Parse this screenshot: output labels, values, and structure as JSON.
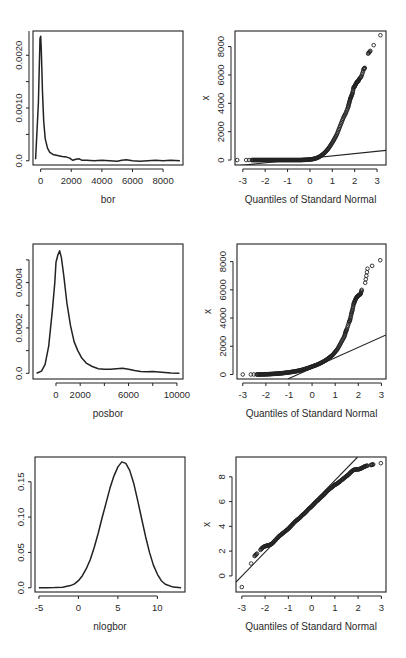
{
  "page": {
    "width": 406,
    "height": 658,
    "background": "#ffffff",
    "ink": "#222222"
  },
  "chart_data": [
    {
      "id": "density-bor",
      "type": "line",
      "title": "",
      "xlabel": "bor",
      "ylabel": "",
      "frame": {
        "x": 33,
        "y": 31,
        "w": 150,
        "h": 134
      },
      "xlim": [
        -500,
        9300
      ],
      "ylim": [
        -8e-05,
        0.00246
      ],
      "xticks": [
        0,
        2000,
        4000,
        6000,
        8000
      ],
      "xticklabels": [
        "0",
        "2000",
        "4000",
        "6000",
        "8000"
      ],
      "yticks": [
        0.0,
        0.0005,
        0.001,
        0.0015,
        0.002,
        0.0025
      ],
      "yticklabels": [
        "0.0",
        "",
        "0.0010",
        "",
        "0.0020",
        ""
      ],
      "grid": false,
      "series": [
        {
          "name": "density",
          "x": [
            -330,
            -150,
            -40,
            0,
            40,
            120,
            200,
            300,
            450,
            600,
            800,
            1100,
            1400,
            1700,
            1900,
            2100,
            2300,
            2500,
            2700,
            3000,
            3500,
            4000,
            4500,
            5000,
            5300,
            5600,
            6000,
            6500,
            7000,
            7500,
            8000,
            8500,
            9100
          ],
          "y": [
            3e-05,
            0.0011,
            0.00232,
            0.00236,
            0.0021,
            0.0013,
            0.00075,
            0.00042,
            0.00024,
            0.00016,
            0.00012,
            0.0001,
            8e-05,
            7e-05,
            5e-05,
            1e-05,
            3e-05,
            4e-05,
            1e-05,
            1e-05,
            0.0,
            1e-05,
            0.0,
            -1e-05,
            1e-05,
            2e-05,
            0.0,
            -1e-05,
            0.0,
            1e-05,
            0.0,
            1e-05,
            0.0
          ]
        }
      ]
    },
    {
      "id": "qq-bor",
      "type": "scatter",
      "title": "",
      "xlabel": "Quantiles of Standard Normal",
      "ylabel": "x",
      "frame": {
        "x": 235,
        "y": 31,
        "w": 151,
        "h": 134
      },
      "xlim": [
        -3.35,
        3.4
      ],
      "ylim": [
        -350,
        9100
      ],
      "xticks": [
        -3,
        -2,
        -1,
        0,
        1,
        2,
        3
      ],
      "xticklabels": [
        "-3",
        "-2",
        "-1",
        "0",
        "1",
        "2",
        "3"
      ],
      "yticks": [
        0,
        2000,
        4000,
        6000,
        8000
      ],
      "yticklabels": [
        "0",
        "2000",
        "4000",
        "6000",
        "8000"
      ],
      "grid": false,
      "reference_line": {
        "x": [
          -3.35,
          3.4
        ],
        "y": [
          -420,
          680
        ]
      },
      "series": [
        {
          "name": "sample quantiles",
          "x": [
            -3.25,
            -2.85,
            -2.72,
            -2.6,
            -2.5,
            -2.4,
            -2.3,
            -2.2,
            -2.1,
            -2.0,
            -1.9,
            -1.8,
            -1.7,
            -1.6,
            -1.5,
            -1.4,
            -1.3,
            -1.2,
            -1.1,
            -1.0,
            -0.9,
            -0.8,
            -0.7,
            -0.6,
            -0.5,
            -0.4,
            -0.3,
            -0.2,
            -0.1,
            0.0,
            0.1,
            0.2,
            0.3,
            0.4,
            0.5,
            0.6,
            0.7,
            0.8,
            0.9,
            1.0,
            1.1,
            1.2,
            1.3,
            1.4,
            1.5,
            1.6,
            1.7,
            1.75,
            1.8,
            1.85,
            1.9,
            1.95,
            2.0,
            2.05,
            2.1,
            2.15,
            2.2,
            2.3,
            2.4,
            2.45,
            2.6,
            2.7,
            2.85,
            3.15
          ],
          "y": [
            0,
            0,
            0,
            0,
            0,
            0,
            0,
            0,
            0,
            0,
            0,
            0,
            0,
            0,
            0,
            0,
            0,
            0,
            0,
            0,
            0,
            0,
            0,
            0,
            0,
            0,
            10,
            15,
            25,
            40,
            60,
            90,
            140,
            210,
            310,
            430,
            580,
            760,
            980,
            1230,
            1500,
            1800,
            2200,
            2600,
            3000,
            3300,
            3700,
            4000,
            4300,
            4500,
            4700,
            5100,
            5200,
            5350,
            5500,
            5550,
            5700,
            5900,
            6400,
            6500,
            7500,
            7700,
            8100,
            8800
          ]
        }
      ]
    },
    {
      "id": "density-posbor",
      "type": "line",
      "title": "",
      "xlabel": "posbor",
      "ylabel": "",
      "frame": {
        "x": 33,
        "y": 244,
        "w": 150,
        "h": 135
      },
      "xlim": [
        -1900,
        10500
      ],
      "ylim": [
        -2.5e-05,
        0.00057
      ],
      "xticks": [
        0,
        2000,
        4000,
        6000,
        8000,
        10000
      ],
      "xticklabels": [
        "0",
        "2000",
        "",
        "6000",
        "",
        "10000"
      ],
      "yticks": [
        0.0,
        0.0001,
        0.0002,
        0.0003,
        0.0004,
        0.0005
      ],
      "yticklabels": [
        "0.0",
        "",
        "0.0002",
        "",
        "0.0004",
        ""
      ],
      "grid": false,
      "series": [
        {
          "name": "density",
          "x": [
            -1600,
            -1200,
            -900,
            -600,
            -300,
            -100,
            0,
            150,
            300,
            450,
            650,
            900,
            1200,
            1500,
            1800,
            2100,
            2500,
            3000,
            3500,
            4000,
            4500,
            5000,
            5500,
            6000,
            6500,
            7000,
            7500,
            8000,
            8500,
            9000,
            9500,
            10200
          ],
          "y": [
            0.0,
            1e-05,
            4e-05,
            0.00012,
            0.00028,
            0.0004,
            0.00049,
            0.00052,
            0.00054,
            0.00051,
            0.00043,
            0.00031,
            0.00021,
            0.00014,
            0.0001,
            7e-05,
            4.5e-05,
            3e-05,
            2e-05,
            1.8e-05,
            1.8e-05,
            2e-05,
            2.2e-05,
            1.8e-05,
            1.2e-05,
            8e-06,
            7e-06,
            8e-06,
            6e-06,
            4e-06,
            2e-06,
            0.0
          ]
        }
      ]
    },
    {
      "id": "qq-posbor",
      "type": "scatter",
      "title": "",
      "xlabel": "Quantiles of Standard Normal",
      "ylabel": "x",
      "frame": {
        "x": 237,
        "y": 244,
        "w": 149,
        "h": 135
      },
      "xlim": [
        -3.25,
        3.2
      ],
      "ylim": [
        -320,
        9250
      ],
      "xticks": [
        -3,
        -2,
        -1,
        0,
        1,
        2,
        3
      ],
      "xticklabels": [
        "-3",
        "-2",
        "-1",
        "0",
        "1",
        "2",
        "3"
      ],
      "yticks": [
        0,
        2000,
        4000,
        6000,
        8000
      ],
      "yticklabels": [
        "0",
        "2000",
        "4000",
        "6000",
        "8000"
      ],
      "grid": false,
      "reference_line": {
        "x": [
          -1.05,
          3.2
        ],
        "y": [
          -320,
          2800
        ]
      },
      "series": [
        {
          "name": "sample quantiles",
          "x": [
            -3.0,
            -2.65,
            -2.52,
            -2.4,
            -2.3,
            -2.2,
            -2.1,
            -2.0,
            -1.9,
            -1.8,
            -1.7,
            -1.6,
            -1.5,
            -1.4,
            -1.3,
            -1.2,
            -1.1,
            -1.0,
            -0.9,
            -0.8,
            -0.7,
            -0.6,
            -0.5,
            -0.4,
            -0.3,
            -0.2,
            -0.1,
            0.0,
            0.1,
            0.2,
            0.3,
            0.4,
            0.5,
            0.6,
            0.7,
            0.8,
            0.9,
            1.0,
            1.1,
            1.2,
            1.3,
            1.4,
            1.45,
            1.5,
            1.6,
            1.65,
            1.7,
            1.75,
            1.8,
            1.85,
            1.9,
            1.95,
            2.0,
            2.1,
            2.15,
            2.3,
            2.4,
            2.6,
            2.95
          ],
          "y": [
            0,
            0,
            0,
            0,
            0,
            5,
            10,
            15,
            20,
            30,
            40,
            50,
            60,
            75,
            90,
            110,
            130,
            150,
            175,
            200,
            230,
            260,
            300,
            340,
            390,
            440,
            500,
            560,
            620,
            680,
            750,
            830,
            920,
            1020,
            1140,
            1260,
            1400,
            1600,
            1800,
            2100,
            2400,
            2700,
            3000,
            3200,
            3700,
            3900,
            4300,
            4600,
            5000,
            5200,
            5400,
            5500,
            5600,
            5700,
            6000,
            6500,
            7500,
            7700,
            8100,
            8800
          ]
        }
      ]
    },
    {
      "id": "density-nlogbor",
      "type": "line",
      "title": "",
      "xlabel": "nlogbor",
      "ylabel": "",
      "frame": {
        "x": 35,
        "y": 457,
        "w": 150,
        "h": 135
      },
      "xlim": [
        -5.5,
        13.5
      ],
      "ylim": [
        -0.006,
        0.185
      ],
      "xticks": [
        -5,
        0,
        5,
        10
      ],
      "xticklabels": [
        "-5",
        "0",
        "5",
        "10"
      ],
      "yticks": [
        0.0,
        0.05,
        0.1,
        0.15
      ],
      "yticklabels": [
        "0.0",
        "0.05",
        "0.10",
        "0.15"
      ],
      "grid": false,
      "series": [
        {
          "name": "density",
          "x": [
            -5,
            -4,
            -3,
            -2,
            -1,
            -0.5,
            0,
            0.5,
            1,
            1.5,
            2,
            2.5,
            3,
            3.5,
            4,
            4.5,
            5,
            5.5,
            6,
            6.5,
            7,
            7.5,
            8,
            8.5,
            9,
            9.5,
            10,
            10.5,
            11,
            12,
            13
          ],
          "y": [
            0.0,
            0.0,
            0.0002,
            0.0008,
            0.003,
            0.0055,
            0.01,
            0.017,
            0.027,
            0.04,
            0.057,
            0.077,
            0.099,
            0.12,
            0.141,
            0.158,
            0.171,
            0.178,
            0.176,
            0.166,
            0.148,
            0.124,
            0.098,
            0.073,
            0.05,
            0.032,
            0.019,
            0.01,
            0.005,
            0.001,
            0.0
          ]
        }
      ]
    },
    {
      "id": "qq-nlogbor",
      "type": "scatter",
      "title": "",
      "xlabel": "Quantiles of Standard Normal",
      "ylabel": "x",
      "frame": {
        "x": 236,
        "y": 457,
        "w": 150,
        "h": 135
      },
      "xlim": [
        -3.25,
        3.2
      ],
      "ylim": [
        -1.3,
        9.6
      ],
      "xticks": [
        -3,
        -2,
        -1,
        0,
        1,
        2,
        3
      ],
      "xticklabels": [
        "-3",
        "-2",
        "-1",
        "0",
        "1",
        "2",
        "3"
      ],
      "yticks": [
        0,
        2,
        4,
        6,
        8
      ],
      "yticklabels": [
        "0",
        "2",
        "4",
        "6",
        "8"
      ],
      "grid": false,
      "reference_line": {
        "x": [
          -3.25,
          1.98
        ],
        "y": [
          -0.5,
          9.6
        ]
      },
      "series": [
        {
          "name": "sample quantiles",
          "x": [
            -3.0,
            -2.6,
            -2.45,
            -2.35,
            -2.2,
            -2.1,
            -2.0,
            -1.9,
            -1.8,
            -1.7,
            -1.6,
            -1.5,
            -1.4,
            -1.3,
            -1.2,
            -1.1,
            -1.0,
            -0.9,
            -0.8,
            -0.7,
            -0.6,
            -0.5,
            -0.4,
            -0.3,
            -0.2,
            -0.1,
            0.0,
            0.1,
            0.2,
            0.3,
            0.4,
            0.5,
            0.6,
            0.7,
            0.8,
            0.9,
            1.0,
            1.1,
            1.2,
            1.3,
            1.4,
            1.5,
            1.6,
            1.7,
            1.8,
            1.9,
            2.0,
            2.1,
            2.2,
            2.3,
            2.4,
            2.55,
            2.65,
            2.98
          ],
          "y": [
            -0.9,
            1.0,
            1.6,
            1.8,
            2.1,
            2.3,
            2.4,
            2.45,
            2.5,
            2.6,
            2.8,
            3.0,
            3.2,
            3.35,
            3.5,
            3.65,
            3.8,
            4.0,
            4.2,
            4.4,
            4.55,
            4.7,
            4.9,
            5.05,
            5.25,
            5.45,
            5.6,
            5.8,
            6.0,
            6.15,
            6.35,
            6.5,
            6.7,
            6.9,
            7.05,
            7.2,
            7.35,
            7.45,
            7.6,
            7.75,
            7.9,
            8.05,
            8.2,
            8.4,
            8.55,
            8.6,
            8.6,
            8.65,
            8.75,
            8.85,
            8.9,
            8.95,
            9.0,
            9.1
          ]
        }
      ]
    }
  ]
}
